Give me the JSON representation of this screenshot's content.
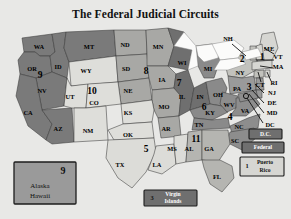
{
  "page": {
    "title": "The Federal Judicial Circuits",
    "background_color": "#e8e8e6"
  },
  "chart_data": {
    "type": "map",
    "title": "The Federal Judicial Circuits",
    "legend_position": "none",
    "categories": [
      "1",
      "2",
      "3",
      "4",
      "5",
      "6",
      "7",
      "8",
      "9",
      "10",
      "11",
      "D.C.",
      "Federal"
    ],
    "circuits": [
      {
        "number": "1",
        "fill": "#d6d6d2",
        "states": [
          "ME",
          "NH",
          "MA",
          "RI",
          "Puerto Rico"
        ]
      },
      {
        "number": "2",
        "fill": "#c2c2bd",
        "states": [
          "NY",
          "VT",
          "CT"
        ]
      },
      {
        "number": "3",
        "fill": "#9a9a9a",
        "states": [
          "PA",
          "NJ",
          "DE",
          "Virgin Islands"
        ]
      },
      {
        "number": "4",
        "fill": "#8d8d8d",
        "states": [
          "MD",
          "WV",
          "VA",
          "NC",
          "SC"
        ]
      },
      {
        "number": "5",
        "fill": "#dcdcd8",
        "states": [
          "TX",
          "LA",
          "MS"
        ]
      },
      {
        "number": "6",
        "fill": "#8a8a8a",
        "states": [
          "MI",
          "OH",
          "KY",
          "TN"
        ]
      },
      {
        "number": "7",
        "fill": "#6f6f6f",
        "states": [
          "WI",
          "IL",
          "IN"
        ]
      },
      {
        "number": "8",
        "fill": "#a8a8a5",
        "states": [
          "ND",
          "SD",
          "NE",
          "MN",
          "IA",
          "MO",
          "AR"
        ]
      },
      {
        "number": "9",
        "fill": "#7a7a7a",
        "states": [
          "WA",
          "OR",
          "ID",
          "MT",
          "NV",
          "CA",
          "AZ",
          "Alaska",
          "Hawaii"
        ]
      },
      {
        "number": "10",
        "fill": "#dedeDa",
        "states": [
          "WY",
          "UT",
          "CO",
          "KS",
          "OK",
          "NM"
        ]
      },
      {
        "number": "11",
        "fill": "#b5b5b1",
        "states": [
          "AL",
          "GA",
          "FL"
        ]
      }
    ],
    "circuit_numbers_on_map": [
      "9",
      "10",
      "8",
      "7",
      "6",
      "5",
      "4",
      "11",
      "3",
      "2",
      "1"
    ],
    "state_labels": [
      "WA",
      "OR",
      "ID",
      "MT",
      "ND",
      "MN",
      "WI",
      "MI",
      "NH",
      "ME",
      "VT",
      "MA",
      "NY",
      "CT",
      "RI",
      "PA",
      "NJ",
      "DE",
      "MD",
      "DC",
      "WY",
      "SD",
      "IA",
      "IL",
      "IN",
      "OH",
      "WV",
      "VA",
      "NC",
      "NV",
      "UT",
      "CO",
      "NE",
      "KY",
      "TN",
      "SC",
      "CA",
      "AZ",
      "NM",
      "KS",
      "MO",
      "AR",
      "MS",
      "AL",
      "GA",
      "OK",
      "TX",
      "LA",
      "FL"
    ],
    "inset_boxes": [
      {
        "name": "alaska-hawaii",
        "number": "9",
        "lines": [
          "Alaska",
          "Hawaii"
        ],
        "style": "mid"
      },
      {
        "name": "virgin-islands",
        "number": "3",
        "lines": [
          "Virgin",
          "Islands"
        ],
        "style": "dark"
      },
      {
        "name": "puerto-rico",
        "number": "1",
        "lines": [
          "Puerto",
          "Rico"
        ],
        "style": "light"
      },
      {
        "name": "dc-circuit",
        "number": "",
        "lines": [
          "D.C."
        ],
        "style": "dark"
      },
      {
        "name": "federal-circuit",
        "number": "",
        "lines": [
          "Federal"
        ],
        "style": "dark"
      }
    ]
  },
  "map": {
    "states": [
      {
        "code": "WA",
        "circuit": "9",
        "fill": "#7a7a7a",
        "lx": 33,
        "ly": 24,
        "d": "M16,12 L46,8 L49,26 L44,30 L34,30 L29,26 L18,26 Z"
      },
      {
        "code": "OR",
        "circuit": "9",
        "fill": "#7a7a7a",
        "lx": 26,
        "ly": 44,
        "d": "M18,26 L29,26 L34,30 L44,30 L46,46 L30,52 L14,48 L12,34 Z"
      },
      {
        "code": "ID",
        "circuit": "9",
        "fill": "#7a7a7a",
        "lx": 52,
        "ly": 40,
        "d": "M46,8 L60,6 L58,22 L63,36 L61,52 L46,46 L44,30 L49,26 Z"
      },
      {
        "code": "MT",
        "circuit": "9",
        "fill": "#7a7a7a",
        "lx": 81,
        "ly": 23,
        "d": "M60,6 L108,4 L110,30 L63,36 L58,22 Z"
      },
      {
        "code": "WY",
        "circuit": "10",
        "fill": "#dededa",
        "lx": 78,
        "ly": 49,
        "d": "M63,36 L110,30 L112,56 L65,60 Z"
      },
      {
        "code": "ND",
        "circuit": "8",
        "fill": "#a8a8a5",
        "lx": 117,
        "ly": 22,
        "d": "M108,4 L140,4 L141,28 L110,30 Z"
      },
      {
        "code": "SD",
        "circuit": "8",
        "fill": "#a8a8a5",
        "lx": 118,
        "ly": 44,
        "d": "M110,30 L141,28 L143,52 L112,56 Z"
      },
      {
        "code": "NE",
        "circuit": "8",
        "fill": "#a8a8a5",
        "lx": 120,
        "ly": 66,
        "d": "M112,56 L143,52 L146,74 L115,78 Z"
      },
      {
        "code": "MN",
        "circuit": "8",
        "fill": "#a8a8a5",
        "lx": 151,
        "ly": 26,
        "d": "M140,4 L162,2 L168,20 L162,40 L141,40 L141,28 Z"
      },
      {
        "code": "IA",
        "circuit": "8",
        "fill": "#a8a8a5",
        "lx": 155,
        "ly": 57,
        "d": "M143,52 L141,40 L162,40 L170,48 L168,62 L146,64 Z"
      },
      {
        "code": "MO",
        "circuit": "8",
        "fill": "#a8a8a5",
        "lx": 157,
        "ly": 82,
        "d": "M146,74 L146,64 L168,62 L175,70 L173,90 L152,92 L148,84 Z"
      },
      {
        "code": "AR",
        "circuit": "8",
        "fill": "#a8a8a5",
        "lx": 158,
        "ly": 104,
        "d": "M152,92 L173,90 L175,110 L155,112 Z"
      },
      {
        "code": "WI",
        "circuit": "7",
        "fill": "#6f6f6f",
        "lx": 176,
        "ly": 40,
        "d": "M162,2 L178,6 L186,24 L182,44 L162,40 L168,20 Z"
      },
      {
        "code": "IL",
        "circuit": "7",
        "fill": "#6f6f6f",
        "lx": 175,
        "ly": 69,
        "d": "M170,48 L182,44 L188,62 L184,84 L173,90 L175,70 L168,62 Z"
      },
      {
        "code": "IN",
        "circuit": "7",
        "fill": "#6f6f6f",
        "lx": 193,
        "ly": 68,
        "d": "M188,62 L200,56 L204,78 L184,84 Z"
      },
      {
        "code": "MI",
        "circuit": "6",
        "fill": "#8a8a8a",
        "lx": 201,
        "ly": 44,
        "d": "M190,20 L206,18 L214,34 L208,52 L198,52 L192,40 Z"
      },
      {
        "code": "OH",
        "circuit": "6",
        "fill": "#8a8a8a",
        "lx": 209,
        "ly": 67,
        "d": "M200,56 L216,52 L221,62 L216,80 L204,78 Z"
      },
      {
        "code": "KY",
        "circuit": "6",
        "fill": "#8a8a8a",
        "lx": 203,
        "ly": 86,
        "d": "M184,84 L204,78 L216,80 L222,86 L206,94 L188,92 Z"
      },
      {
        "code": "TN",
        "circuit": "6",
        "fill": "#8a8a8a",
        "lx": 193,
        "ly": 100,
        "d": "M188,92 L206,94 L222,92 L224,102 L186,104 Z"
      },
      {
        "code": "NY",
        "circuit": "2",
        "fill": "#c2c2bd",
        "lx": 233,
        "ly": 45,
        "d": "M218,34 L236,26 L252,30 L250,44 L236,52 L222,50 Z"
      },
      {
        "code": "PA",
        "circuit": "3",
        "fill": "#9a9a9a",
        "lx": 231,
        "ly": 62,
        "d": "M222,50 L236,52 L248,50 L250,64 L224,68 Z"
      },
      {
        "code": "WV",
        "circuit": "4",
        "fill": "#8d8d8d",
        "lx": 222,
        "ly": 79,
        "d": "M216,66 L224,68 L232,70 L230,82 L221,86 L214,78 Z"
      },
      {
        "code": "VA",
        "circuit": "4",
        "fill": "#8d8d8d",
        "lx": 238,
        "ly": 84,
        "d": "M230,72 L248,70 L254,78 L240,90 L224,90 L230,82 Z"
      },
      {
        "code": "NC",
        "circuit": "4",
        "fill": "#8d8d8d",
        "lx": 232,
        "ly": 101,
        "d": "M224,100 L242,92 L254,88 L252,102 L226,108 Z"
      },
      {
        "code": "SC",
        "circuit": "4",
        "fill": "#8d8d8d",
        "lx": 228,
        "ly": 115,
        "d": "M224,106 L248,102 L250,112 L236,124 L220,116 Z"
      },
      {
        "code": "NV",
        "circuit": "9",
        "fill": "#7a7a7a",
        "lx": 36,
        "ly": 66,
        "d": "M46,46 L61,52 L58,80 L36,84 L30,52 Z"
      },
      {
        "code": "CA",
        "circuit": "9",
        "fill": "#7a7a7a",
        "lx": 22,
        "ly": 90,
        "d": "M14,48 L30,52 L36,84 L46,98 L40,114 L22,100 L10,70 Z"
      },
      {
        "code": "AZ",
        "circuit": "9",
        "fill": "#7a7a7a",
        "lx": 53,
        "ly": 104,
        "d": "M36,84 L66,82 L68,116 L46,118 L40,114 L46,98 Z"
      },
      {
        "code": "UT",
        "circuit": "10",
        "fill": "#dededa",
        "lx": 64,
        "ly": 72,
        "d": "M58,80 L61,52 L65,60 L82,58 L80,82 L66,82 Z"
      },
      {
        "code": "CO",
        "circuit": "10",
        "fill": "#dededa",
        "lx": 88,
        "ly": 76,
        "d": "M82,58 L112,56 L115,78 L80,82 Z"
      },
      {
        "code": "NM",
        "circuit": "10",
        "fill": "#dededa",
        "lx": 82,
        "ly": 106,
        "d": "M68,82 L80,82 L100,80 L102,114 L68,116 Z"
      },
      {
        "code": "KS",
        "circuit": "10",
        "fill": "#dededa",
        "lx": 120,
        "ly": 88,
        "d": "M115,78 L146,74 L148,84 L146,96 L117,98 Z"
      },
      {
        "code": "OK",
        "circuit": "10",
        "fill": "#dededa",
        "lx": 120,
        "ly": 110,
        "d": "M102,104 L117,98 L146,96 L148,112 L108,114 Z"
      },
      {
        "code": "TX",
        "circuit": "5",
        "fill": "#dcdcd8",
        "lx": 113,
        "ly": 140,
        "d": "M102,114 L148,112 L150,126 L140,146 L126,162 L112,152 L100,132 Z"
      },
      {
        "code": "LA",
        "circuit": "5",
        "fill": "#dcdcd8",
        "lx": 152,
        "ly": 139,
        "d": "M150,120 L168,118 L170,138 L156,148 L142,144 L148,128 Z"
      },
      {
        "code": "MS",
        "circuit": "5",
        "fill": "#dcdcd8",
        "lx": 165,
        "ly": 124,
        "d": "M168,110 L182,108 L180,136 L170,138 L168,118 Z"
      },
      {
        "code": "AL",
        "circuit": "11",
        "fill": "#b5b5b1",
        "lx": 183,
        "ly": 124,
        "d": "M182,106 L196,104 L196,134 L180,136 Z"
      },
      {
        "code": "GA",
        "circuit": "11",
        "fill": "#b5b5b1",
        "lx": 202,
        "ly": 124,
        "d": "M196,104 L222,104 L224,118 L212,136 L196,134 Z"
      },
      {
        "code": "FL",
        "circuit": "11",
        "fill": "#b5b5b1",
        "lx": 210,
        "ly": 152,
        "d": "M196,134 L214,134 L226,140 L228,152 L216,166 L204,158 L198,142 Z"
      },
      {
        "code": "ME",
        "circuit": "1",
        "fill": "#d6d6d2",
        "lx": 263,
        "ly": 28,
        "d": "M256,8 L268,6 L272,22 L264,38 L254,32 L254,18 Z"
      },
      {
        "code": "NH",
        "circuit": "1",
        "fill": "#d6d6d2",
        "lx": 0,
        "ly": 0,
        "d": "M250,20 L256,18 L258,34 L250,34 Z"
      },
      {
        "code": "VT",
        "circuit": "2",
        "fill": "#c2c2bd",
        "lx": 0,
        "ly": 0,
        "d": "M244,20 L250,20 L250,34 L244,34 Z"
      },
      {
        "code": "MA",
        "circuit": "1",
        "fill": "#d6d6d2",
        "lx": 0,
        "ly": 0,
        "d": "M246,36 L266,34 L266,42 L246,44 Z"
      },
      {
        "code": "CT",
        "circuit": "2",
        "fill": "#c2c2bd",
        "lx": 0,
        "ly": 0,
        "d": "M248,45 L258,44 L258,51 L248,52 Z"
      },
      {
        "code": "RI",
        "circuit": "1",
        "fill": "#d6d6d2",
        "lx": 0,
        "ly": 0,
        "d": "M259,44 L264,44 L264,51 L259,51 Z"
      },
      {
        "code": "NJ",
        "circuit": "3",
        "fill": "#9a9a9a",
        "lx": 0,
        "ly": 0,
        "d": "M250,52 L257,52 L258,64 L250,64 Z"
      },
      {
        "code": "DE",
        "circuit": "3",
        "fill": "#9a9a9a",
        "lx": 0,
        "ly": 0,
        "d": "M250,64 L256,64 L256,72 L250,72 Z"
      },
      {
        "code": "MD",
        "circuit": "4",
        "fill": "#8d8d8d",
        "lx": 0,
        "ly": 0,
        "d": "M232,68 L250,64 L252,72 L234,76 Z"
      }
    ],
    "state_text": [
      {
        "code": "WA",
        "x": 33,
        "y": 22
      },
      {
        "code": "OR",
        "x": 26,
        "y": 44
      },
      {
        "code": "ID",
        "x": 52,
        "y": 42
      },
      {
        "code": "MT",
        "x": 83,
        "y": 22
      },
      {
        "code": "WY",
        "x": 80,
        "y": 46
      },
      {
        "code": "ND",
        "x": 119,
        "y": 20
      },
      {
        "code": "SD",
        "x": 120,
        "y": 44
      },
      {
        "code": "NE",
        "x": 122,
        "y": 66
      },
      {
        "code": "MN",
        "x": 152,
        "y": 22
      },
      {
        "code": "IA",
        "x": 156,
        "y": 55
      },
      {
        "code": "MO",
        "x": 158,
        "y": 82
      },
      {
        "code": "AR",
        "x": 160,
        "y": 104
      },
      {
        "code": "WI",
        "x": 176,
        "y": 38
      },
      {
        "code": "IL",
        "x": 176,
        "y": 72
      },
      {
        "code": "IN",
        "x": 194,
        "y": 72
      },
      {
        "code": "MI",
        "x": 202,
        "y": 44
      },
      {
        "code": "OH",
        "x": 212,
        "y": 70
      },
      {
        "code": "KY",
        "x": 204,
        "y": 88
      },
      {
        "code": "TN",
        "x": 193,
        "y": 100
      },
      {
        "code": "NY",
        "x": 234,
        "y": 48
      },
      {
        "code": "PA",
        "x": 231,
        "y": 64
      },
      {
        "code": "WV",
        "x": 223,
        "y": 80
      },
      {
        "code": "VA",
        "x": 239,
        "y": 86
      },
      {
        "code": "NC",
        "x": 233,
        "y": 102
      },
      {
        "code": "SC",
        "x": 229,
        "y": 116
      },
      {
        "code": "NV",
        "x": 36,
        "y": 66
      },
      {
        "code": "CA",
        "x": 22,
        "y": 88
      },
      {
        "code": "AZ",
        "x": 52,
        "y": 104
      },
      {
        "code": "UT",
        "x": 64,
        "y": 72
      },
      {
        "code": "CO",
        "x": 88,
        "y": 78
      },
      {
        "code": "NM",
        "x": 82,
        "y": 106
      },
      {
        "code": "KS",
        "x": 122,
        "y": 88
      },
      {
        "code": "OK",
        "x": 122,
        "y": 110
      },
      {
        "code": "TX",
        "x": 114,
        "y": 140
      },
      {
        "code": "LA",
        "x": 151,
        "y": 140
      },
      {
        "code": "MS",
        "x": 166,
        "y": 124
      },
      {
        "code": "AL",
        "x": 183,
        "y": 124
      },
      {
        "code": "GA",
        "x": 203,
        "y": 124
      },
      {
        "code": "FL",
        "x": 211,
        "y": 152
      },
      {
        "code": "ME",
        "x": 263,
        "y": 24
      },
      {
        "code": "NH",
        "x": 222,
        "y": 14
      },
      {
        "code": "VT",
        "x": 272,
        "y": 32
      },
      {
        "code": "MA",
        "x": 272,
        "y": 42
      },
      {
        "code": "CT",
        "x": 254,
        "y": 60
      },
      {
        "code": "RI",
        "x": 268,
        "y": 58
      },
      {
        "code": "NJ",
        "x": 266,
        "y": 68
      },
      {
        "code": "DE",
        "x": 266,
        "y": 78
      },
      {
        "code": "MD",
        "x": 266,
        "y": 88
      },
      {
        "code": "DC",
        "x": 264,
        "y": 100
      }
    ],
    "circuit_numbers": [
      {
        "n": "9",
        "x": 34,
        "y": 50
      },
      {
        "n": "10",
        "x": 86,
        "y": 66
      },
      {
        "n": "8",
        "x": 140,
        "y": 46
      },
      {
        "n": "7",
        "x": 173,
        "y": 58
      },
      {
        "n": "6",
        "x": 198,
        "y": 82
      },
      {
        "n": "5",
        "x": 140,
        "y": 124
      },
      {
        "n": "4",
        "x": 224,
        "y": 92
      },
      {
        "n": "11",
        "x": 190,
        "y": 114
      },
      {
        "n": "3",
        "x": 243,
        "y": 62
      },
      {
        "n": "2",
        "x": 236,
        "y": 34
      },
      {
        "n": "1",
        "x": 256,
        "y": 32
      }
    ]
  },
  "insets": {
    "alaska_hawaii": {
      "number": "9",
      "line1": "Alaska",
      "line2": "Hawaii"
    },
    "virgin_islands": {
      "number": "3",
      "line1": "Virgin",
      "line2": "Islands"
    },
    "puerto_rico": {
      "number": "1",
      "line1": "Puerto",
      "line2": "Rico"
    },
    "dc": {
      "label": "D.C."
    },
    "federal": {
      "label": "Federal"
    }
  }
}
